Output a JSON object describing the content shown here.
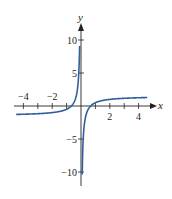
{
  "chart_data": {
    "type": "line",
    "title": "",
    "xlabel": "x",
    "ylabel": "y",
    "xlim": [
      -4.5,
      4.6
    ],
    "ylim": [
      -11.5,
      13
    ],
    "x_ticks": [
      -4,
      -3,
      -2,
      -1,
      1,
      2,
      3,
      4
    ],
    "x_tick_labels": [
      {
        "value": -4,
        "label": "−4"
      },
      {
        "value": -2,
        "label": "−2"
      },
      {
        "value": 2,
        "label": "2"
      },
      {
        "value": 4,
        "label": "4"
      }
    ],
    "y_ticks": [
      -10,
      -5,
      5,
      10
    ],
    "y_tick_labels": [
      {
        "value": 10,
        "label": "10"
      },
      {
        "value": 5,
        "label": "5"
      },
      {
        "value": -5,
        "label": "−5"
      },
      {
        "value": -10,
        "label": "−10"
      }
    ],
    "grid": false,
    "legend": null,
    "vertical_asymptote": 0,
    "horizontal_asymptotes": {
      "left": -1.5,
      "right": 1.5
    },
    "series": [
      {
        "name": "curve",
        "color": "#2f5f9e",
        "branches": [
          {
            "x": [
              -4.5,
              -4,
              -3,
              -2,
              -1.5,
              -1,
              -0.7,
              -0.5,
              -0.3,
              -0.2,
              -0.15,
              -0.1,
              -0.085
            ],
            "y": [
              -1.72,
              -1.75,
              -1.83,
              -2.0,
              -2.17,
              -2.5,
              -1.07,
              0.5,
              1.83,
              3.5,
              5.17,
              8.5,
              10.3
            ]
          },
          {
            "x": [
              0.085,
              0.1,
              0.15,
              0.2,
              0.3,
              0.5,
              0.7,
              1,
              1.5,
              2,
              3,
              4,
              4.5
            ],
            "y": [
              -10.3,
              -8.5,
              -5.17,
              -3.5,
              -1.83,
              -0.5,
              0.07,
              0.5,
              0.83,
              1.0,
              1.17,
              1.25,
              1.28
            ]
          }
        ]
      }
    ]
  },
  "axes": {
    "x_label": "x",
    "y_label": "y",
    "color": "#222222"
  }
}
